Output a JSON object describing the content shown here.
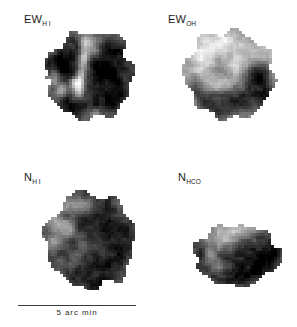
{
  "figure": {
    "width": 297,
    "height": 327,
    "background_color": "#ffffff",
    "ink_color": "#1a1a1a",
    "type": "four-panel-grayscale-map-array"
  },
  "panels": [
    {
      "id": "ew-hi",
      "label_main": "EW",
      "label_sub": "H I",
      "label_x": 24,
      "label_y": 14,
      "map_x": 42,
      "map_y": 28,
      "map_w": 96,
      "map_h": 96
    },
    {
      "id": "ew-oh",
      "label_main": "EW",
      "label_sub": "OH",
      "label_x": 168,
      "label_y": 14,
      "map_x": 182,
      "map_y": 28,
      "map_w": 96,
      "map_h": 96
    },
    {
      "id": "n-h-left",
      "label_main": "N",
      "label_sub": "H I",
      "label_x": 24,
      "label_y": 172,
      "map_x": 42,
      "map_y": 190,
      "map_w": 96,
      "map_h": 100
    },
    {
      "id": "n-h-right",
      "label_main": "N",
      "label_sub": "HCO",
      "label_x": 178,
      "label_y": 172,
      "map_x": 190,
      "map_y": 218,
      "map_w": 92,
      "map_h": 72
    }
  ],
  "scalebar": {
    "label": "5 arc min",
    "line_x": 18,
    "line_y": 305,
    "line_w": 118,
    "line_h": 1,
    "label_y": 309
  },
  "map_data": {
    "pixel_size": 3,
    "note": "Each panel is a pixelated grayscale intensity map; 0 = white background, 1 = black.",
    "maps": [
      {
        "id": "ew-hi",
        "seed": 1471,
        "outline": {
          "cx": 0.5,
          "cy": 0.5,
          "rx": 0.455,
          "ry": 0.47,
          "edge_rough": 0.085,
          "lobes": 7
        },
        "spur": {
          "x": 0.02,
          "y": 0.48,
          "w": 0.14,
          "h": 0.055
        },
        "base_level": 0.8,
        "grain": 0.09,
        "blobs": [
          {
            "cx": 0.26,
            "cy": 0.4,
            "rx": 0.17,
            "ry": 0.21,
            "amp": 0.22
          },
          {
            "cx": 0.7,
            "cy": 0.42,
            "rx": 0.22,
            "ry": 0.24,
            "amp": 0.24
          },
          {
            "cx": 0.72,
            "cy": 0.74,
            "rx": 0.18,
            "ry": 0.17,
            "amp": 0.2
          },
          {
            "cx": 0.3,
            "cy": 0.78,
            "rx": 0.15,
            "ry": 0.14,
            "amp": 0.16
          },
          {
            "cx": 0.47,
            "cy": 0.13,
            "rx": 0.1,
            "ry": 0.09,
            "amp": -0.55
          },
          {
            "cx": 0.44,
            "cy": 0.3,
            "rx": 0.055,
            "ry": 0.16,
            "amp": -0.6
          },
          {
            "cx": 0.4,
            "cy": 0.52,
            "rx": 0.05,
            "ry": 0.13,
            "amp": -0.52
          },
          {
            "cx": 0.38,
            "cy": 0.66,
            "rx": 0.07,
            "ry": 0.11,
            "amp": -0.58
          },
          {
            "cx": 0.34,
            "cy": 0.56,
            "rx": 0.06,
            "ry": 0.08,
            "amp": -0.4
          },
          {
            "cx": 0.2,
            "cy": 0.64,
            "rx": 0.085,
            "ry": 0.09,
            "amp": -0.42
          },
          {
            "cx": 0.13,
            "cy": 0.5,
            "rx": 0.075,
            "ry": 0.1,
            "amp": -0.34
          },
          {
            "cx": 0.55,
            "cy": 0.9,
            "rx": 0.13,
            "ry": 0.075,
            "amp": -0.34
          },
          {
            "cx": 0.55,
            "cy": 0.24,
            "rx": 0.065,
            "ry": 0.08,
            "amp": -0.28
          },
          {
            "cx": 0.88,
            "cy": 0.55,
            "rx": 0.07,
            "ry": 0.1,
            "amp": -0.2
          }
        ]
      },
      {
        "id": "ew-oh",
        "seed": 2803,
        "outline": {
          "cx": 0.5,
          "cy": 0.5,
          "rx": 0.455,
          "ry": 0.47,
          "edge_rough": 0.09,
          "lobes": 8
        },
        "spur": {
          "x": 0.01,
          "y": 0.46,
          "w": 0.12,
          "h": 0.05
        },
        "base_level": 0.4,
        "grain": 0.085,
        "blobs": [
          {
            "cx": 0.44,
            "cy": 0.17,
            "rx": 0.26,
            "ry": 0.15,
            "amp": -0.36
          },
          {
            "cx": 0.22,
            "cy": 0.36,
            "rx": 0.17,
            "ry": 0.18,
            "amp": -0.26
          },
          {
            "cx": 0.58,
            "cy": 0.4,
            "rx": 0.12,
            "ry": 0.12,
            "amp": -0.22
          },
          {
            "cx": 0.8,
            "cy": 0.26,
            "rx": 0.13,
            "ry": 0.13,
            "amp": -0.22
          },
          {
            "cx": 0.78,
            "cy": 0.5,
            "rx": 0.16,
            "ry": 0.16,
            "amp": 0.5
          },
          {
            "cx": 0.62,
            "cy": 0.76,
            "rx": 0.26,
            "ry": 0.2,
            "amp": 0.52
          },
          {
            "cx": 0.3,
            "cy": 0.8,
            "rx": 0.19,
            "ry": 0.16,
            "amp": 0.44
          },
          {
            "cx": 0.14,
            "cy": 0.62,
            "rx": 0.11,
            "ry": 0.13,
            "amp": 0.28
          },
          {
            "cx": 0.9,
            "cy": 0.72,
            "rx": 0.1,
            "ry": 0.14,
            "amp": 0.4
          },
          {
            "cx": 0.48,
            "cy": 0.57,
            "rx": 0.09,
            "ry": 0.08,
            "amp": -0.18
          },
          {
            "cx": 0.36,
            "cy": 0.6,
            "rx": 0.1,
            "ry": 0.09,
            "amp": -0.14
          }
        ]
      },
      {
        "id": "n-h-left",
        "seed": 3917,
        "outline": {
          "cx": 0.5,
          "cy": 0.5,
          "rx": 0.45,
          "ry": 0.475,
          "edge_rough": 0.085,
          "lobes": 7
        },
        "spur": {
          "x": 0.0,
          "y": 0.44,
          "w": 0.13,
          "h": 0.05
        },
        "base_level": 0.82,
        "grain": 0.085,
        "blobs": [
          {
            "cx": 0.38,
            "cy": 0.16,
            "rx": 0.22,
            "ry": 0.12,
            "amp": -0.48
          },
          {
            "cx": 0.18,
            "cy": 0.32,
            "rx": 0.15,
            "ry": 0.16,
            "amp": -0.46
          },
          {
            "cx": 0.3,
            "cy": 0.4,
            "rx": 0.1,
            "ry": 0.1,
            "amp": -0.3
          },
          {
            "cx": 0.24,
            "cy": 0.26,
            "rx": 0.07,
            "ry": 0.07,
            "amp": 0.26
          },
          {
            "cx": 0.11,
            "cy": 0.52,
            "rx": 0.09,
            "ry": 0.11,
            "amp": -0.34
          },
          {
            "cx": 0.43,
            "cy": 0.52,
            "rx": 0.08,
            "ry": 0.1,
            "amp": -0.22
          },
          {
            "cx": 0.36,
            "cy": 0.7,
            "rx": 0.09,
            "ry": 0.08,
            "amp": -0.18
          },
          {
            "cx": 0.2,
            "cy": 0.72,
            "rx": 0.08,
            "ry": 0.08,
            "amp": -0.16
          },
          {
            "cx": 0.72,
            "cy": 0.4,
            "rx": 0.2,
            "ry": 0.22,
            "amp": 0.16
          },
          {
            "cx": 0.66,
            "cy": 0.78,
            "rx": 0.22,
            "ry": 0.18,
            "amp": 0.16
          },
          {
            "cx": 0.55,
            "cy": 0.95,
            "rx": 0.12,
            "ry": 0.07,
            "amp": 0.12
          }
        ]
      },
      {
        "id": "n-h-right",
        "seed": 5233,
        "outline": {
          "cx": 0.5,
          "cy": 0.52,
          "rx": 0.47,
          "ry": 0.42,
          "edge_rough": 0.095,
          "lobes": 6
        },
        "spur": null,
        "base_level": 0.8,
        "grain": 0.085,
        "blobs": [
          {
            "cx": 0.52,
            "cy": 0.16,
            "rx": 0.3,
            "ry": 0.15,
            "amp": -0.52
          },
          {
            "cx": 0.34,
            "cy": 0.3,
            "rx": 0.2,
            "ry": 0.16,
            "amp": -0.38
          },
          {
            "cx": 0.2,
            "cy": 0.52,
            "rx": 0.1,
            "ry": 0.13,
            "amp": -0.3
          },
          {
            "cx": 0.13,
            "cy": 0.5,
            "rx": 0.07,
            "ry": 0.09,
            "amp": 0.22
          },
          {
            "cx": 0.3,
            "cy": 0.66,
            "rx": 0.1,
            "ry": 0.1,
            "amp": -0.22
          },
          {
            "cx": 0.68,
            "cy": 0.55,
            "rx": 0.24,
            "ry": 0.26,
            "amp": 0.2
          },
          {
            "cx": 0.9,
            "cy": 0.44,
            "rx": 0.12,
            "ry": 0.16,
            "amp": 0.16
          },
          {
            "cx": 0.5,
            "cy": 0.8,
            "rx": 0.18,
            "ry": 0.12,
            "amp": 0.18
          }
        ]
      }
    ]
  }
}
